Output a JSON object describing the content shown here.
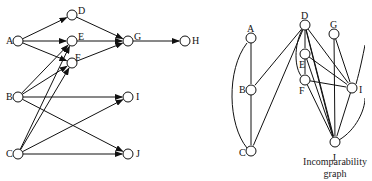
{
  "left_graph": {
    "nodes": [
      {
        "id": "A",
        "x": 18,
        "y": 41,
        "lx": 6,
        "ly": 36
      },
      {
        "id": "D",
        "x": 72,
        "y": 15,
        "lx": 78,
        "ly": 6
      },
      {
        "id": "E",
        "x": 72,
        "y": 41,
        "lx": 78,
        "ly": 32
      },
      {
        "id": "F",
        "x": 72,
        "y": 63,
        "lx": 75,
        "ly": 53
      },
      {
        "id": "G",
        "x": 128,
        "y": 41,
        "lx": 134,
        "ly": 32
      },
      {
        "id": "H",
        "x": 185,
        "y": 41,
        "lx": 192,
        "ly": 36
      },
      {
        "id": "B",
        "x": 18,
        "y": 97,
        "lx": 6,
        "ly": 92
      },
      {
        "id": "I",
        "x": 128,
        "y": 97,
        "lx": 136,
        "ly": 92
      },
      {
        "id": "C",
        "x": 18,
        "y": 154,
        "lx": 6,
        "ly": 149
      },
      {
        "id": "J",
        "x": 128,
        "y": 154,
        "lx": 136,
        "ly": 149
      }
    ],
    "edges": [
      [
        "A",
        "D"
      ],
      [
        "A",
        "E"
      ],
      [
        "A",
        "F"
      ],
      [
        "D",
        "G"
      ],
      [
        "E",
        "G"
      ],
      [
        "F",
        "G"
      ],
      [
        "G",
        "H"
      ],
      [
        "B",
        "E"
      ],
      [
        "B",
        "F"
      ],
      [
        "B",
        "I"
      ],
      [
        "B",
        "J"
      ],
      [
        "C",
        "E"
      ],
      [
        "C",
        "F"
      ],
      [
        "C",
        "I"
      ],
      [
        "C",
        "J"
      ]
    ]
  },
  "right_graph": {
    "caption_line1": "Incomparability",
    "caption_line2": "graph",
    "nodes": [
      {
        "id": "A",
        "x": 251,
        "y": 38,
        "lx": 247,
        "ly": 24
      },
      {
        "id": "B",
        "x": 251,
        "y": 90,
        "lx": 239,
        "ly": 85
      },
      {
        "id": "C",
        "x": 251,
        "y": 151,
        "lx": 239,
        "ly": 148
      },
      {
        "id": "D",
        "x": 305,
        "y": 25,
        "lx": 301,
        "ly": 11
      },
      {
        "id": "G",
        "x": 334,
        "y": 34,
        "lx": 330,
        "ly": 20
      },
      {
        "id": "E",
        "x": 305,
        "y": 54,
        "lx": 299,
        "ly": 60
      },
      {
        "id": "F",
        "x": 305,
        "y": 80,
        "lx": 299,
        "ly": 86
      },
      {
        "id": "I",
        "x": 352,
        "y": 88,
        "lx": 359,
        "ly": 85
      },
      {
        "id": "J",
        "x": 335,
        "y": 142,
        "lx": 332,
        "ly": 153
      }
    ],
    "edges": [
      [
        "A",
        "B"
      ],
      [
        "B",
        "C"
      ],
      [
        "D",
        "B"
      ],
      [
        "D",
        "C"
      ],
      [
        "D",
        "E"
      ],
      [
        "D",
        "I"
      ],
      [
        "D",
        "J"
      ],
      [
        "E",
        "F"
      ],
      [
        "E",
        "I"
      ],
      [
        "E",
        "J"
      ],
      [
        "F",
        "I"
      ],
      [
        "F",
        "J"
      ],
      [
        "G",
        "I"
      ],
      [
        "G",
        "J"
      ],
      [
        "I",
        "J"
      ]
    ]
  }
}
